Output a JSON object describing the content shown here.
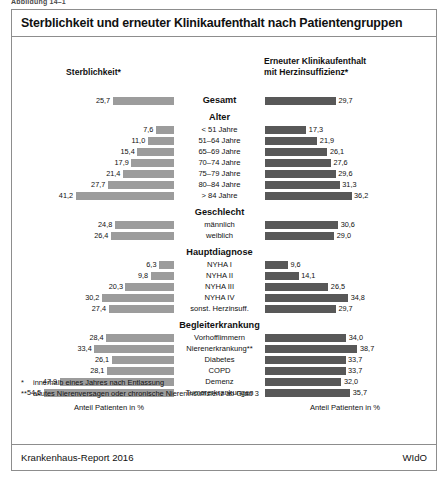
{
  "figure_caption": "Abbildung 14–1",
  "title": "Sterblichkeit und erneuter Klinikaufenthalt nach Patientengruppen",
  "columns": {
    "left_header": "Sterblichkeit*",
    "right_header_line1": "Erneuter Klinikaufenthalt",
    "right_header_line2": "mit Herzinsuffizienz*"
  },
  "axis_caption_left": "Anteil Patienten in %",
  "axis_caption_right": "Anteil Patienten in %",
  "footnotes": [
    {
      "mark": "*",
      "text": "innerhalb eines Jahres nach Entlassung"
    },
    {
      "mark": "**",
      "text": "akutes Nierenversagen oder chronische Niereninsuffizienz ab Grad 3"
    }
  ],
  "source": "Krankenhaus-Report 2016",
  "publisher": "WIdO",
  "colors": {
    "bar_left": "#9c9c9c",
    "bar_right": "#585858",
    "frame": "#8d8d8d"
  },
  "chart_data": {
    "type": "bar",
    "title": "Sterblichkeit und erneuter Klinikaufenthalt nach Patientengruppen",
    "orientation": "horizontal",
    "layout": "back-to-back paired bars, left series right-aligned, right series left-aligned",
    "xlabel": "Anteil Patienten in %",
    "ylabel": "",
    "xlim": [
      0,
      60
    ],
    "grid": false,
    "legend_position": "column headers",
    "series": [
      {
        "name": "Sterblichkeit*",
        "side": "left",
        "color": "#9c9c9c"
      },
      {
        "name": "Erneuter Klinikaufenthalt mit Herzinsuffizienz*",
        "side": "right",
        "color": "#585858"
      }
    ],
    "groups": [
      {
        "heading": "",
        "rows": [
          {
            "label": "Gesamt",
            "bold": true,
            "left": 25.7,
            "right": 29.7,
            "left_text": "25,7",
            "right_text": "29,7"
          }
        ]
      },
      {
        "heading": "Alter",
        "rows": [
          {
            "label": "< 51 Jahre",
            "left": 7.6,
            "right": 17.3,
            "left_text": "7,6",
            "right_text": "17,3"
          },
          {
            "label": "51–64 Jahre",
            "left": 11.0,
            "right": 21.9,
            "left_text": "11,0",
            "right_text": "21,9"
          },
          {
            "label": "65–69 Jahre",
            "left": 15.4,
            "right": 26.1,
            "left_text": "15,4",
            "right_text": "26,1"
          },
          {
            "label": "70–74 Jahre",
            "left": 17.9,
            "right": 27.6,
            "left_text": "17,9",
            "right_text": "27,6"
          },
          {
            "label": "75–79 Jahre",
            "left": 21.4,
            "right": 29.6,
            "left_text": "21,4",
            "right_text": "29,6"
          },
          {
            "label": "80–84 Jahre",
            "left": 27.7,
            "right": 31.3,
            "left_text": "27,7",
            "right_text": "31,3"
          },
          {
            "label": "> 84 Jahre",
            "left": 41.2,
            "right": 36.2,
            "left_text": "41,2",
            "right_text": "36,2"
          }
        ]
      },
      {
        "heading": "Geschlecht",
        "rows": [
          {
            "label": "männlich",
            "left": 24.8,
            "right": 30.6,
            "left_text": "24,8",
            "right_text": "30,6"
          },
          {
            "label": "weiblich",
            "left": 26.4,
            "right": 29.0,
            "left_text": "26,4",
            "right_text": "29,0"
          }
        ]
      },
      {
        "heading": "Hauptdiagnose",
        "rows": [
          {
            "label": "NYHA I",
            "left": 6.3,
            "right": 9.6,
            "left_text": "6,3",
            "right_text": "9,6"
          },
          {
            "label": "NYHA II",
            "left": 9.8,
            "right": 14.1,
            "left_text": "9,8",
            "right_text": "14,1"
          },
          {
            "label": "NYHA III",
            "left": 20.3,
            "right": 26.5,
            "left_text": "20,3",
            "right_text": "26,5"
          },
          {
            "label": "NYHA IV",
            "left": 30.2,
            "right": 34.8,
            "left_text": "30,2",
            "right_text": "34,8"
          },
          {
            "label": "sonst. Herzinsuff.",
            "left": 27.4,
            "right": 29.7,
            "left_text": "27,4",
            "right_text": "29,7"
          }
        ]
      },
      {
        "heading": "Begleiterkrankung",
        "rows": [
          {
            "label": "Vorhofflimmern",
            "left": 28.4,
            "right": 34.0,
            "left_text": "28,4",
            "right_text": "34,0"
          },
          {
            "label": "Nierenerkrankung**",
            "left": 33.4,
            "right": 38.7,
            "left_text": "33,4",
            "right_text": "38,7"
          },
          {
            "label": "Diabetes",
            "left": 26.1,
            "right": 33.7,
            "left_text": "26,1",
            "right_text": "33,7"
          },
          {
            "label": "COPD",
            "left": 28.1,
            "right": 33.7,
            "left_text": "28,1",
            "right_text": "33,7"
          },
          {
            "label": "Demenz",
            "left": 47.9,
            "right": 32.0,
            "left_text": "47,9",
            "right_text": "32,0"
          },
          {
            "label": "Tumorerkrankungen",
            "left": 54.5,
            "right": 35.7,
            "left_text": "54,5",
            "right_text": "35,7"
          }
        ]
      }
    ]
  }
}
